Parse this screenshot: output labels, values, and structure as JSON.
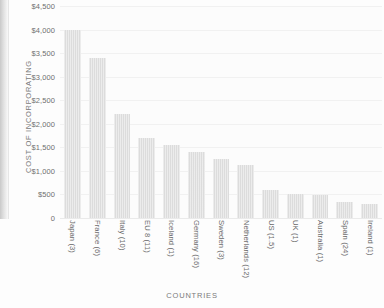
{
  "chart_data": {
    "type": "bar",
    "title": "",
    "xlabel": "Countries",
    "ylabel": "Cost of Incorporating",
    "categories": [
      "Japan (3)",
      "France (6)",
      "Italy (10)",
      "EU 8 (11)",
      "Iceland (1)",
      "Germany (16)",
      "Sweden (3)",
      "Netherlands (12)",
      "US (1.5)",
      "UK (1)",
      "Australia (1)",
      "Spain (24)",
      "Ireland (1)"
    ],
    "values": [
      4000,
      3400,
      2200,
      1700,
      1550,
      1400,
      1250,
      1120,
      600,
      500,
      480,
      330,
      300
    ],
    "ylim": [
      0,
      4500
    ],
    "yticks": [
      0,
      500,
      1000,
      1500,
      2000,
      2500,
      3000,
      3500,
      4000,
      4500
    ],
    "ytick_labels": [
      "0",
      "$500",
      "$1,000",
      "$1,500",
      "$2,000",
      "$2,500",
      "$3,000",
      "$3,500",
      "$4,000",
      "$4,500"
    ],
    "grid": true,
    "legend": false,
    "bar_color": "#dcdcdc",
    "background_color": "#fcfcfc",
    "text_color": "#6f6f6f"
  }
}
